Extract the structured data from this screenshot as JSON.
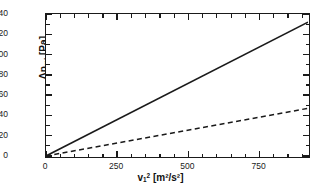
{
  "chart_data": {
    "type": "line",
    "title": "",
    "xlabel": "v₁² [m²/s²]",
    "ylabel": "Δp_rel [Pa]",
    "xlabel_parts": {
      "base": "v",
      "sub": "1",
      "sup": "2",
      "unit": "[m²/s²]"
    },
    "ylabel_parts": {
      "base": "Δp",
      "sub": "rel",
      "unit": "[Pa]"
    },
    "xlim": [
      0,
      920
    ],
    "ylim": [
      0,
      140
    ],
    "grid": false,
    "legend": "none",
    "x_ticks": [
      0,
      250,
      500,
      750
    ],
    "x_tick_labels": [
      "0",
      "250",
      "500",
      "750"
    ],
    "x_minor_step": 50,
    "y_ticks": [
      0,
      20,
      40,
      60,
      80,
      100,
      120,
      140
    ],
    "y_tick_labels": [
      "0",
      "20",
      "40",
      "60",
      "80",
      "100",
      "120",
      "140"
    ],
    "y_minor_step": 10,
    "series": [
      {
        "name": "solid-line",
        "style": "solid",
        "color": "#1a1a1a",
        "slope": 0.1435,
        "x": [
          0,
          920
        ],
        "values": [
          0,
          132
        ]
      },
      {
        "name": "dashed-line",
        "style": "dashed",
        "color": "#1a1a1a",
        "slope": 0.0511,
        "x": [
          0,
          920
        ],
        "values": [
          0,
          47
        ]
      }
    ]
  }
}
